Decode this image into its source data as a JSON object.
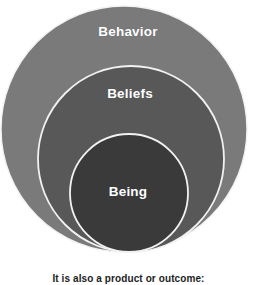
{
  "diagram": {
    "type": "nested-circles",
    "title": "",
    "rings": [
      {
        "id": "behavior",
        "label": "Behavior",
        "level": 1,
        "fill_color": "#7a7a7a",
        "stroke_color": "#f2f2f2",
        "center_x": 124,
        "center_y": 129,
        "radius": 124
      },
      {
        "id": "beliefs",
        "label": "Beliefs",
        "level": 2,
        "fill_color": "#585858",
        "stroke_color": "#f2f2f2",
        "center_x": 131,
        "center_y": 159,
        "radius": 94
      },
      {
        "id": "being",
        "label": "Being",
        "level": 3,
        "fill_color": "#3a3a3a",
        "stroke_color": "#f2f2f2",
        "center_x": 129,
        "center_y": 193,
        "radius": 60
      }
    ]
  },
  "caption": {
    "text": "It is also a product or outcome:"
  },
  "colors": {
    "background": "#ffffff",
    "outer_ring": "#7a7a7a",
    "middle_ring": "#585858",
    "inner_ring": "#3a3a3a",
    "ring_stroke": "#f2f2f2",
    "label_text": "#ffffff",
    "caption_text": "#1d1d1d"
  }
}
